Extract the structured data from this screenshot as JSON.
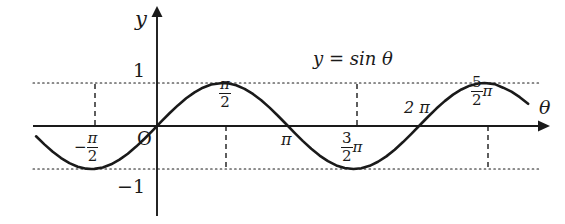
{
  "figure": {
    "kind": "sine-curve-graph",
    "background_color": "#ffffff",
    "ink_color": "#1a1a1a",
    "curve_label": "y = sin θ",
    "axis_labels": {
      "x": "θ",
      "y": "y",
      "origin": "O"
    },
    "y_ticks": [
      {
        "label": "1",
        "value": 1
      },
      {
        "label": "−1",
        "value": -1
      }
    ],
    "x_ticks": [
      {
        "parts": {
          "sign": "−",
          "num": "π",
          "den": "2"
        },
        "value": -1.5708,
        "position": "below"
      },
      {
        "parts": {
          "sign": "",
          "num": "π",
          "den": "2"
        },
        "value": 1.5708,
        "position": "above"
      },
      {
        "plain": "π",
        "value": 3.1416,
        "position": "below"
      },
      {
        "parts": {
          "sign": "",
          "num": "3",
          "den": "2",
          "suffix": "π"
        },
        "value": 4.7124,
        "position": "below"
      },
      {
        "plain": "2 π",
        "value": 6.2832,
        "position": "above"
      },
      {
        "parts": {
          "sign": "",
          "num": "5",
          "den": "2",
          "suffix": "π"
        },
        "value": 7.854,
        "position": "above"
      }
    ]
  },
  "chart_data": {
    "type": "line",
    "title": "",
    "subtitle": "",
    "xlabel": "θ",
    "ylabel": "y",
    "grid": false,
    "legend": "none",
    "annotations": [
      {
        "text": "y = sin θ",
        "x": 4.71,
        "y": 1.35
      }
    ],
    "guide_lines": {
      "horizontal_dotted": [
        1,
        -1
      ],
      "vertical_dashed_at": [
        -1.5708,
        1.5708,
        4.7124,
        7.854
      ]
    },
    "xlim": [
      -3.3,
      9.9
    ],
    "ylim": [
      -1.55,
      1.85
    ],
    "xticks": [
      -1.5708,
      1.5708,
      3.1416,
      4.7124,
      6.2832,
      7.854
    ],
    "xticklabels": [
      "-π/2",
      "π/2",
      "π",
      "3π/2",
      "2π",
      "5π/2"
    ],
    "yticks": [
      1,
      -1
    ],
    "yticklabels": [
      "1",
      "−1"
    ],
    "series": [
      {
        "name": "y = sin θ",
        "formula": "y = sin(theta)",
        "x": [
          -3.3,
          -3.1,
          -2.9,
          -2.7,
          -2.5,
          -2.3,
          -2.1,
          -1.9,
          -1.7,
          -1.5708,
          -1.5,
          -1.3,
          -1.1,
          -0.9,
          -0.7,
          -0.5,
          -0.3,
          -0.1,
          0.0,
          0.1,
          0.3,
          0.5,
          0.7,
          0.9,
          1.1,
          1.3,
          1.5708,
          1.7,
          1.9,
          2.1,
          2.3,
          2.5,
          2.7,
          2.9,
          3.1416,
          3.3,
          3.5,
          3.7,
          3.9,
          4.1,
          4.3,
          4.5,
          4.7124,
          4.9,
          5.1,
          5.3,
          5.5,
          5.7,
          5.9,
          6.1,
          6.2832,
          6.5,
          6.7,
          6.9,
          7.1,
          7.3,
          7.5,
          7.7,
          7.854,
          8.1,
          8.3,
          8.5,
          8.7,
          8.9,
          9.1,
          9.3,
          9.5,
          9.7,
          9.9
        ],
        "y": [
          0.158,
          0.042,
          -0.239,
          -0.427,
          -0.599,
          -0.746,
          -0.863,
          -0.946,
          -0.992,
          -1.0,
          -0.997,
          -0.964,
          -0.891,
          -0.783,
          -0.644,
          -0.479,
          -0.296,
          -0.1,
          0.0,
          0.1,
          0.296,
          0.479,
          0.644,
          0.783,
          0.891,
          0.964,
          1.0,
          0.992,
          0.946,
          0.863,
          0.746,
          0.599,
          0.427,
          0.239,
          0.0,
          -0.158,
          -0.351,
          -0.53,
          -0.688,
          -0.818,
          -0.916,
          -0.978,
          -1.0,
          -0.982,
          -0.926,
          -0.832,
          -0.706,
          -0.551,
          -0.374,
          -0.182,
          0.0,
          0.215,
          0.405,
          0.579,
          0.729,
          0.85,
          0.938,
          0.99,
          1.0,
          0.974,
          0.891,
          0.798,
          0.671,
          0.516,
          0.34,
          0.15,
          -0.075,
          -0.28,
          -0.47
        ]
      }
    ]
  }
}
